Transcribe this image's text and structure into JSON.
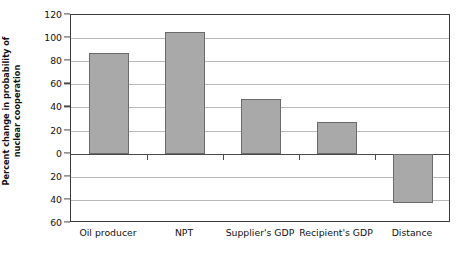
{
  "chart_data": {
    "type": "bar",
    "title": "",
    "xlabel": "",
    "ylabel": "Percent change in probability of nuclear cooperation",
    "categories": [
      "Oil producer",
      "NPT",
      "Supplier's GDP",
      "Recipient's GDP",
      "Distance"
    ],
    "values": [
      87,
      105,
      47,
      27,
      -43
    ],
    "ylim": [
      -60,
      120
    ],
    "yticks": [
      120,
      100,
      80,
      60,
      40,
      20,
      0,
      -20,
      -40,
      -60
    ],
    "ytick_labels": [
      "120",
      "100",
      "80",
      "60",
      "40",
      "20",
      "0",
      "20",
      "40",
      "60"
    ],
    "grid": true,
    "legend": "none",
    "bar_color": "#a9a9a9",
    "bar_edge_color": "#6b6b6b",
    "gridline_color": "#b9b9b9",
    "axis_color": "#3a3a3a"
  },
  "ylabel_lines": {
    "line1": "Percent change in probability of",
    "line2": "nuclear cooperation"
  }
}
